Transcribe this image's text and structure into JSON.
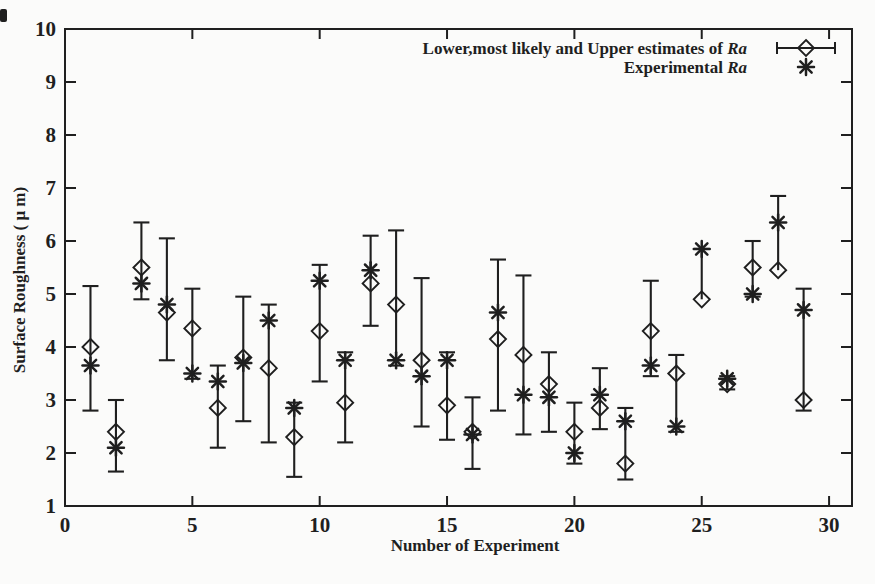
{
  "figure": {
    "background": "#fbfbfa",
    "ink": "#1f1f1f"
  },
  "chart_data": {
    "type": "scatter",
    "title": "",
    "xlabel": "Number of Experiment",
    "ylabel": "Surface Roughness ( μ m)",
    "xlim": [
      0,
      30.9
    ],
    "ylim": [
      1,
      10
    ],
    "x_ticks": [
      0,
      5,
      10,
      15,
      20,
      25,
      30
    ],
    "y_ticks": [
      1,
      2,
      3,
      4,
      5,
      6,
      7,
      8,
      9,
      10
    ],
    "grid": false,
    "legend_position": "top-right-inside",
    "legend": [
      {
        "text": "Lower,most likely and Upper estimates of ",
        "italic": "Ra",
        "marker": "diamond-with-error-bar"
      },
      {
        "text": "Experimental ",
        "italic": "Ra",
        "marker": "asterisk"
      }
    ],
    "x": [
      1,
      2,
      3,
      4,
      5,
      6,
      7,
      8,
      9,
      10,
      11,
      12,
      13,
      14,
      15,
      16,
      17,
      18,
      19,
      20,
      21,
      22,
      23,
      24,
      25,
      26,
      27,
      28,
      29
    ],
    "series": [
      {
        "name": "Lower,most likely and Upper estimates of Ra",
        "marker": "diamond",
        "lower": [
          2.8,
          1.65,
          4.9,
          3.75,
          3.4,
          2.1,
          2.6,
          2.2,
          1.55,
          3.35,
          2.2,
          4.4,
          3.65,
          2.5,
          2.25,
          1.7,
          2.8,
          2.35,
          2.4,
          1.8,
          2.45,
          1.5,
          3.45,
          2.4,
          4.9,
          3.2,
          4.95,
          5.45,
          2.8
        ],
        "most_likely": [
          4.0,
          2.4,
          5.5,
          4.65,
          4.35,
          2.85,
          3.8,
          3.6,
          2.3,
          4.3,
          2.95,
          5.2,
          4.8,
          3.75,
          2.9,
          2.4,
          4.15,
          3.85,
          3.3,
          2.4,
          2.85,
          1.8,
          4.3,
          3.5,
          4.9,
          3.3,
          5.5,
          5.45,
          3.0
        ],
        "upper": [
          5.15,
          3.0,
          6.35,
          6.05,
          5.1,
          3.65,
          4.95,
          4.8,
          2.95,
          5.55,
          3.9,
          6.1,
          6.2,
          5.3,
          3.9,
          3.05,
          5.65,
          5.35,
          3.9,
          2.95,
          3.6,
          2.85,
          5.25,
          3.85,
          5.85,
          3.45,
          6.0,
          6.85,
          5.1
        ]
      },
      {
        "name": "Experimental Ra",
        "marker": "asterisk",
        "values": [
          3.65,
          2.1,
          5.2,
          4.8,
          3.5,
          3.35,
          3.7,
          4.5,
          2.85,
          5.25,
          3.75,
          5.45,
          3.75,
          3.45,
          3.75,
          2.35,
          4.65,
          3.1,
          3.05,
          2.0,
          3.1,
          2.6,
          3.65,
          2.5,
          5.85,
          3.4,
          5.0,
          6.35,
          4.7
        ]
      }
    ]
  }
}
